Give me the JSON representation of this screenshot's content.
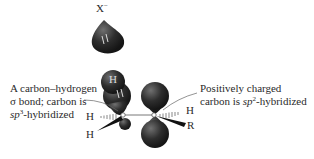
{
  "diagram": {
    "nucleophile": {
      "label": "X",
      "charge": "−"
    },
    "left_annotation": {
      "line1": "A carbon–hydrogen",
      "line2": "σ bond; carbon is",
      "line3_prefix": "sp",
      "line3_sup": "3",
      "line3_suffix": "-hybridized"
    },
    "right_annotation": {
      "line1": "Positively charged",
      "line2_prefix": "carbon is ",
      "line2_italic": "sp",
      "line2_sup": "2",
      "line2_suffix": "-hybridized"
    },
    "atoms": {
      "orbital_h": "H",
      "left_h_top": "H",
      "left_h_bottom": "H",
      "right_h": "H",
      "right_r": "R"
    },
    "colors": {
      "orbital": "#2b2b2b",
      "orbital_highlight": "#6a6a6a",
      "text": "#2a2a2a",
      "line": "#555555"
    }
  }
}
